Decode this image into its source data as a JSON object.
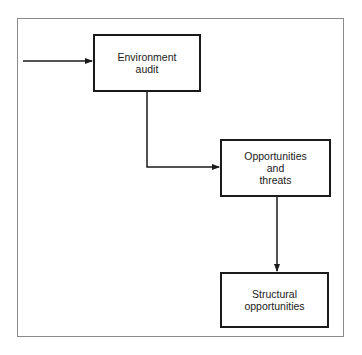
{
  "diagram": {
    "nodes": [
      {
        "id": "environment-audit",
        "label": "Environment\naudit"
      },
      {
        "id": "opportunities-threats",
        "label": "Opportunities\nand\nthreats"
      },
      {
        "id": "structural-opportunities",
        "label": "Structural\nopportunities"
      }
    ],
    "edges": [
      {
        "from": "external-input",
        "to": "environment-audit"
      },
      {
        "from": "environment-audit",
        "to": "opportunities-threats"
      },
      {
        "from": "opportunities-threats",
        "to": "structural-opportunities"
      }
    ]
  }
}
